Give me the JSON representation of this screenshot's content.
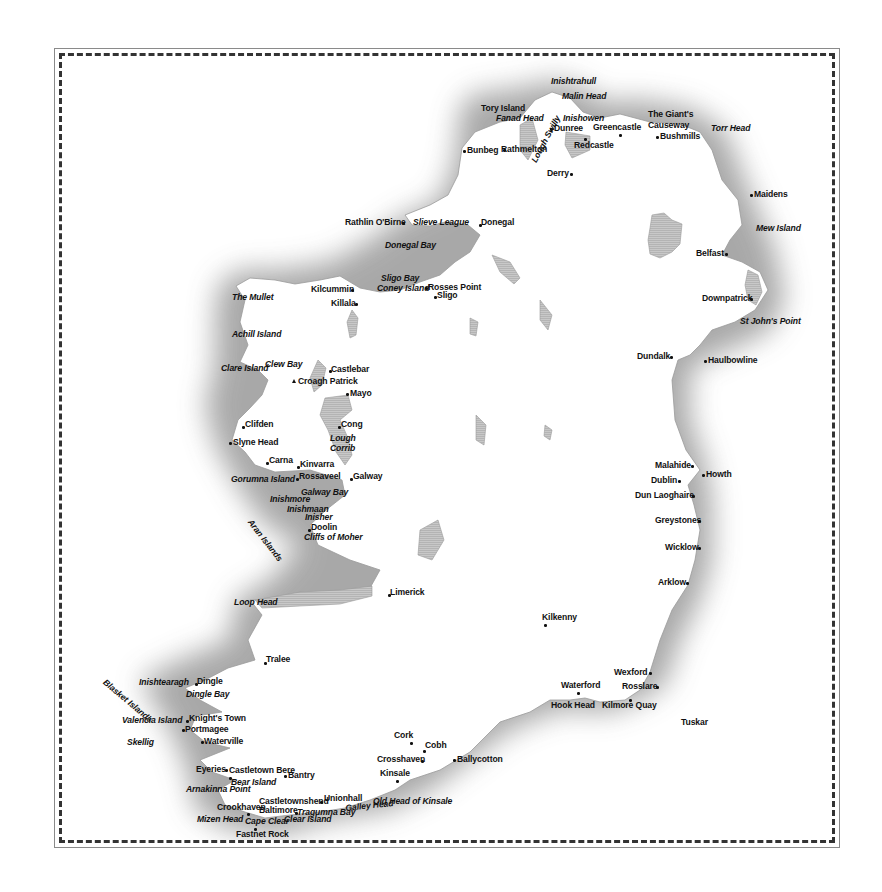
{
  "map": {
    "title": "Ireland",
    "colors": {
      "land": "#ffffff",
      "sea_shade": "#a9a9a9",
      "lake": "#c4c4c4",
      "text": "#111111",
      "border": "#333333"
    },
    "labels": [
      {
        "text": "Inishtrahull",
        "x": 551,
        "y": 77,
        "italic": true,
        "marker": "none"
      },
      {
        "text": "Malin Head",
        "x": 562,
        "y": 92,
        "italic": true,
        "marker": "none"
      },
      {
        "text": "Tory Island",
        "x": 481,
        "y": 104,
        "italic": false,
        "marker": "none"
      },
      {
        "text": "Fanad Head",
        "x": 496,
        "y": 114,
        "italic": true,
        "marker": "none"
      },
      {
        "text": "Inishowen",
        "x": 563,
        "y": 114,
        "italic": true,
        "marker": "none"
      },
      {
        "text": "Dunree",
        "x": 554,
        "y": 124,
        "italic": false,
        "marker": "dot-left",
        "dx": -4,
        "dy": 4
      },
      {
        "text": "Greencastle",
        "x": 593,
        "y": 123,
        "italic": false,
        "marker": "dot-below",
        "dx": 26,
        "dy": 11
      },
      {
        "text": "Bunbeg",
        "x": 467,
        "y": 146,
        "italic": false,
        "marker": "dot-left",
        "dx": -4,
        "dy": 4
      },
      {
        "text": "Rathmelton",
        "x": 501,
        "y": 145,
        "italic": false,
        "marker": "dot-right",
        "dx": 2,
        "dy": 4
      },
      {
        "text": "Redcastle",
        "x": 574,
        "y": 141,
        "italic": false,
        "marker": "dot-above",
        "dx": 10,
        "dy": -3
      },
      {
        "text": "Lough Swilly",
        "x": 530,
        "y": 160,
        "italic": true,
        "marker": "none",
        "rotate": -62
      },
      {
        "text": "Derry",
        "x": 547,
        "y": 169,
        "italic": false,
        "marker": "dot-right",
        "dx": 23,
        "dy": 4
      },
      {
        "text": "The Giant's",
        "x": 648,
        "y": 110,
        "italic": false,
        "marker": "none"
      },
      {
        "text": "Causeway",
        "x": 648,
        "y": 121,
        "italic": false,
        "marker": "none"
      },
      {
        "text": "Bushmills",
        "x": 660,
        "y": 132,
        "italic": false,
        "marker": "dot-left",
        "dx": -4,
        "dy": 4
      },
      {
        "text": "Torr Head",
        "x": 711,
        "y": 124,
        "italic": true,
        "marker": "none"
      },
      {
        "text": "Maidens",
        "x": 754,
        "y": 190,
        "italic": false,
        "marker": "dot-left",
        "dx": -4,
        "dy": 4
      },
      {
        "text": "Mew Island",
        "x": 756,
        "y": 224,
        "italic": true,
        "marker": "none"
      },
      {
        "text": "Rathlin O'Birne",
        "x": 345,
        "y": 218,
        "italic": false,
        "marker": "dot-right",
        "dx": 57,
        "dy": 4
      },
      {
        "text": "Slieve League",
        "x": 413,
        "y": 218,
        "italic": true,
        "marker": "none"
      },
      {
        "text": "Donegal",
        "x": 481,
        "y": 218,
        "italic": false,
        "marker": "dot-left",
        "dx": -2,
        "dy": 6
      },
      {
        "text": "Donegal Bay",
        "x": 385,
        "y": 241,
        "italic": true,
        "marker": "none"
      },
      {
        "text": "Belfast",
        "x": 696,
        "y": 249,
        "italic": false,
        "marker": "dot-right",
        "dx": 29,
        "dy": 4
      },
      {
        "text": "Sligo Bay",
        "x": 381,
        "y": 274,
        "italic": true,
        "marker": "none"
      },
      {
        "text": "Coney Island",
        "x": 377,
        "y": 284,
        "italic": true,
        "marker": "none"
      },
      {
        "text": "Rosses Point",
        "x": 428,
        "y": 283,
        "italic": false,
        "marker": "dot-left",
        "dx": -3,
        "dy": 4
      },
      {
        "text": "Sligo",
        "x": 437,
        "y": 291,
        "italic": false,
        "marker": "dot-left",
        "dx": -3,
        "dy": 5
      },
      {
        "text": "Kilcummin",
        "x": 311,
        "y": 285,
        "italic": false,
        "marker": "dot-right",
        "dx": 40,
        "dy": 4
      },
      {
        "text": "Killala",
        "x": 331,
        "y": 299,
        "italic": false,
        "marker": "dot-right",
        "dx": 24,
        "dy": 4
      },
      {
        "text": "The Mullet",
        "x": 232,
        "y": 293,
        "italic": true,
        "marker": "none"
      },
      {
        "text": "Downpatrick",
        "x": 702,
        "y": 294,
        "italic": false,
        "marker": "dot-right",
        "dx": 48,
        "dy": 4
      },
      {
        "text": "Achill Island",
        "x": 232,
        "y": 330,
        "italic": true,
        "marker": "none"
      },
      {
        "text": "St John's Point",
        "x": 740,
        "y": 317,
        "italic": true,
        "marker": "none"
      },
      {
        "text": "Dundalk",
        "x": 637,
        "y": 352,
        "italic": false,
        "marker": "dot-right",
        "dx": 33,
        "dy": 4
      },
      {
        "text": "Haulbowline",
        "x": 708,
        "y": 356,
        "italic": false,
        "marker": "dot-left",
        "dx": -4,
        "dy": 4
      },
      {
        "text": "Clare Island",
        "x": 221,
        "y": 364,
        "italic": true,
        "marker": "none"
      },
      {
        "text": "Clew Bay",
        "x": 265,
        "y": 360,
        "italic": true,
        "marker": "none"
      },
      {
        "text": "Castlebar",
        "x": 331,
        "y": 365,
        "italic": false,
        "marker": "dot-left",
        "dx": -2,
        "dy": 5
      },
      {
        "text": "Croagh Patrick",
        "x": 298,
        "y": 377,
        "italic": false,
        "marker": "triangle-left",
        "dx": -6,
        "dy": 2
      },
      {
        "text": "Mayo",
        "x": 350,
        "y": 389,
        "italic": false,
        "marker": "dot-left",
        "dx": -4,
        "dy": 4
      },
      {
        "text": "Clifden",
        "x": 245,
        "y": 420,
        "italic": false,
        "marker": "dot-left",
        "dx": -3,
        "dy": 6
      },
      {
        "text": "Cong",
        "x": 341,
        "y": 420,
        "italic": false,
        "marker": "dot-left",
        "dx": -3,
        "dy": 6
      },
      {
        "text": "Slyne Head",
        "x": 233,
        "y": 438,
        "italic": false,
        "marker": "dot-left",
        "dx": -4,
        "dy": 4
      },
      {
        "text": "Lough",
        "x": 330,
        "y": 434,
        "italic": true,
        "marker": "none"
      },
      {
        "text": "Corrib",
        "x": 330,
        "y": 444,
        "italic": true,
        "marker": "none"
      },
      {
        "text": "Carna",
        "x": 269,
        "y": 456,
        "italic": false,
        "marker": "dot-left",
        "dx": -3,
        "dy": 6
      },
      {
        "text": "Kinvarra",
        "x": 300,
        "y": 460,
        "italic": false,
        "marker": "dot-left",
        "dx": -3,
        "dy": 6
      },
      {
        "text": "Malahide",
        "x": 655,
        "y": 461,
        "italic": false,
        "marker": "dot-right",
        "dx": 36,
        "dy": 4
      },
      {
        "text": "Howth",
        "x": 706,
        "y": 470,
        "italic": false,
        "marker": "dot-left",
        "dx": -4,
        "dy": 4
      },
      {
        "text": "Gorumna Island",
        "x": 231,
        "y": 475,
        "italic": true,
        "marker": "none"
      },
      {
        "text": "Rossaveel",
        "x": 299,
        "y": 472,
        "italic": false,
        "marker": "dot-left",
        "dx": -3,
        "dy": 6
      },
      {
        "text": "Galway",
        "x": 353,
        "y": 472,
        "italic": false,
        "marker": "dot-left",
        "dx": -3,
        "dy": 6
      },
      {
        "text": "Dublin",
        "x": 651,
        "y": 476,
        "italic": false,
        "marker": "dot-right",
        "dx": 27,
        "dy": 4
      },
      {
        "text": "Dun Laoghaire",
        "x": 635,
        "y": 491,
        "italic": false,
        "marker": "dot-right",
        "dx": 57,
        "dy": 4
      },
      {
        "text": "Galway Bay",
        "x": 301,
        "y": 488,
        "italic": true,
        "marker": "none"
      },
      {
        "text": "Inishmore",
        "x": 270,
        "y": 495,
        "italic": true,
        "marker": "none"
      },
      {
        "text": "Inishmaan",
        "x": 287,
        "y": 505,
        "italic": true,
        "marker": "none"
      },
      {
        "text": "Inisher",
        "x": 305,
        "y": 513,
        "italic": true,
        "marker": "none"
      },
      {
        "text": "Aran Islands",
        "x": 253,
        "y": 518,
        "italic": true,
        "marker": "none",
        "rotate": 52
      },
      {
        "text": "Greystones",
        "x": 655,
        "y": 516,
        "italic": false,
        "marker": "dot-right",
        "dx": 43,
        "dy": 4
      },
      {
        "text": "Doolin",
        "x": 311,
        "y": 523,
        "italic": false,
        "marker": "dot-left",
        "dx": -3,
        "dy": 6
      },
      {
        "text": "Cliffs of Moher",
        "x": 304,
        "y": 533,
        "italic": true,
        "marker": "none"
      },
      {
        "text": "Wicklow",
        "x": 665,
        "y": 543,
        "italic": false,
        "marker": "dot-right",
        "dx": 33,
        "dy": 4
      },
      {
        "text": "Arklow",
        "x": 658,
        "y": 578,
        "italic": false,
        "marker": "dot-right",
        "dx": 28,
        "dy": 4
      },
      {
        "text": "Limerick",
        "x": 390,
        "y": 588,
        "italic": false,
        "marker": "dot-left",
        "dx": -2,
        "dy": 6
      },
      {
        "text": "Loop Head",
        "x": 234,
        "y": 598,
        "italic": true,
        "marker": "none"
      },
      {
        "text": "Kilkenny",
        "x": 542,
        "y": 613,
        "italic": false,
        "marker": "dot-below",
        "dx": 2,
        "dy": 11
      },
      {
        "text": "Tralee",
        "x": 266,
        "y": 655,
        "italic": false,
        "marker": "dot-left",
        "dx": -2,
        "dy": 7
      },
      {
        "text": "Wexford",
        "x": 614,
        "y": 668,
        "italic": false,
        "marker": "dot-right",
        "dx": 35,
        "dy": 4
      },
      {
        "text": "Blasket Islands",
        "x": 107,
        "y": 678,
        "italic": true,
        "marker": "none",
        "rotate": 40
      },
      {
        "text": "Inishtearagh",
        "x": 139,
        "y": 678,
        "italic": true,
        "marker": "none"
      },
      {
        "text": "Dingle",
        "x": 197,
        "y": 677,
        "italic": false,
        "marker": "dot-left",
        "dx": -2,
        "dy": 6
      },
      {
        "text": "Waterford",
        "x": 561,
        "y": 681,
        "italic": false,
        "marker": "dot-below",
        "dx": 16,
        "dy": 11
      },
      {
        "text": "Rosslare",
        "x": 622,
        "y": 682,
        "italic": false,
        "marker": "dot-right",
        "dx": 34,
        "dy": 4
      },
      {
        "text": "Dingle Bay",
        "x": 186,
        "y": 690,
        "italic": true,
        "marker": "none"
      },
      {
        "text": "Hook Head",
        "x": 551,
        "y": 701,
        "italic": false,
        "marker": "none"
      },
      {
        "text": "Kilmore Quay",
        "x": 602,
        "y": 701,
        "italic": false,
        "marker": "dot-above",
        "dx": 27,
        "dy": -2
      },
      {
        "text": "Tuskar",
        "x": 681,
        "y": 718,
        "italic": false,
        "marker": "none"
      },
      {
        "text": "Valencia Island",
        "x": 122,
        "y": 716,
        "italic": true,
        "marker": "none"
      },
      {
        "text": "Knight's Town",
        "x": 189,
        "y": 714,
        "italic": false,
        "marker": "dot-left",
        "dx": -3,
        "dy": 6
      },
      {
        "text": "Portmagee",
        "x": 185,
        "y": 725,
        "italic": false,
        "marker": "dot-left",
        "dx": -3,
        "dy": 4
      },
      {
        "text": "Skellig",
        "x": 127,
        "y": 738,
        "italic": true,
        "marker": "none"
      },
      {
        "text": "Waterville",
        "x": 204,
        "y": 737,
        "italic": false,
        "marker": "dot-left",
        "dx": -3,
        "dy": 4
      },
      {
        "text": "Cork",
        "x": 394,
        "y": 731,
        "italic": false,
        "marker": "dot-below",
        "dx": 16,
        "dy": 11
      },
      {
        "text": "Cobh",
        "x": 425,
        "y": 741,
        "italic": false,
        "marker": "dot-below",
        "dx": -2,
        "dy": 9
      },
      {
        "text": "Crosshaven",
        "x": 377,
        "y": 755,
        "italic": false,
        "marker": "dot-right",
        "dx": 44,
        "dy": 5
      },
      {
        "text": "Ballycotton",
        "x": 457,
        "y": 755,
        "italic": false,
        "marker": "dot-left",
        "dx": -4,
        "dy": 4
      },
      {
        "text": "Kinsale",
        "x": 380,
        "y": 769,
        "italic": false,
        "marker": "dot-below",
        "dx": 16,
        "dy": 11
      },
      {
        "text": "Eyeries",
        "x": 196,
        "y": 765,
        "italic": false,
        "marker": "dot-right",
        "dx": 29,
        "dy": 4
      },
      {
        "text": "Castletown Bere",
        "x": 229,
        "y": 766,
        "italic": false,
        "marker": "dot-below",
        "dx": 0,
        "dy": 11
      },
      {
        "text": "Bantry",
        "x": 288,
        "y": 771,
        "italic": false,
        "marker": "dot-left",
        "dx": -4,
        "dy": 4
      },
      {
        "text": "Bear Island",
        "x": 231,
        "y": 778,
        "italic": true,
        "marker": "none"
      },
      {
        "text": "Arnakinna Point",
        "x": 186,
        "y": 785,
        "italic": true,
        "marker": "none"
      },
      {
        "text": "Old Head of Kinsale",
        "x": 373,
        "y": 797,
        "italic": true,
        "marker": "none"
      },
      {
        "text": "Castletownshend",
        "x": 259,
        "y": 797,
        "italic": false,
        "marker": "dot-right",
        "dx": 61,
        "dy": 4
      },
      {
        "text": "Unionhall",
        "x": 324,
        "y": 794,
        "italic": false,
        "marker": "none"
      },
      {
        "text": "Crookhaven",
        "x": 217,
        "y": 803,
        "italic": false,
        "marker": "dot-below",
        "dx": 30,
        "dy": 10
      },
      {
        "text": "Baltimore",
        "x": 259,
        "y": 806,
        "italic": false,
        "marker": "none"
      },
      {
        "text": "Tragumna Bay",
        "x": 297,
        "y": 808,
        "italic": true,
        "marker": "dot-left",
        "dx": -2,
        "dy": 4
      },
      {
        "text": "Galley Head",
        "x": 345,
        "y": 804,
        "italic": true,
        "marker": "none",
        "rotate": -6
      },
      {
        "text": "Mizen Head",
        "x": 197,
        "y": 815,
        "italic": true,
        "marker": "none"
      },
      {
        "text": "Cape Clear",
        "x": 245,
        "y": 817,
        "italic": true,
        "marker": "none"
      },
      {
        "text": "Clear Island",
        "x": 284,
        "y": 815,
        "italic": true,
        "marker": "none"
      },
      {
        "text": "Fastnet Rock",
        "x": 236,
        "y": 830,
        "italic": false,
        "marker": "dot-above",
        "dx": 18,
        "dy": -2
      }
    ]
  }
}
